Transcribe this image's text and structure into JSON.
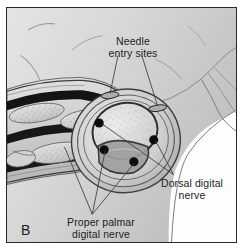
{
  "figure": {
    "panel_letter": "B",
    "type": "anatomical-illustration",
    "view": "longitudinal finger with transverse cross-section"
  },
  "labels": {
    "needle_entry": "Needle\nentry sites",
    "dorsal_nerve": "Dorsal digital\nnerve",
    "palmar_nerve": "Proper palmar\ndigital nerve"
  },
  "markers": {
    "needle_entry_sites": [
      {
        "cx": 104,
        "cy": 88,
        "rx": 9,
        "ry": 3.2,
        "rotate": -8
      },
      {
        "cx": 152,
        "cy": 101,
        "rx": 9,
        "ry": 3.2,
        "rotate": -8
      }
    ],
    "nerve_dots": [
      {
        "name": "dorsal-radial",
        "cx": 93,
        "cy": 116,
        "r": 4.6
      },
      {
        "name": "dorsal-ulnar",
        "cx": 148,
        "cy": 133,
        "r": 4.6
      },
      {
        "name": "palmar-radial",
        "cx": 98,
        "cy": 143,
        "r": 4.6
      },
      {
        "name": "palmar-ulnar",
        "cx": 128,
        "cy": 155,
        "r": 4.6
      }
    ]
  },
  "colors": {
    "frame_border": "#2a2a2a",
    "background_light": "#e2e2e2",
    "background_mid": "#d2d2d2",
    "background_dark": "#bdbdbd",
    "skin_tone": "#cccccc",
    "bone_fill": "#d9d9d9",
    "tendon_dark": "#1a1a1a",
    "nerve_dot": "#0d0d0d",
    "leader_line": "#3a3a3a",
    "text": "#1d1d1d",
    "page_white": "#ffffff"
  }
}
